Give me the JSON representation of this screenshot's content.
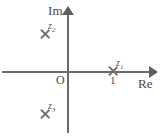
{
  "figure": {
    "background_color": "#ffffff",
    "line_color": "#6a6a6a"
  },
  "axes": {
    "imaginary_label": "Im",
    "real_label": "Re",
    "origin_label": "O",
    "tick_labels": [
      "1"
    ]
  },
  "chart_data": {
    "type": "scatter",
    "title": "",
    "xlabel": "Re",
    "ylabel": "Im",
    "xlim": [
      -1.6,
      2.1
    ],
    "ylim": [
      -1.7,
      1.6
    ],
    "grid": false,
    "legend": "none",
    "marker": "x",
    "xticks": [
      1
    ],
    "xticklabels": [
      "1"
    ],
    "yticks": [],
    "yticklabels": [],
    "points": [
      {
        "label": "z1",
        "label_text": "z",
        "subscript": "1",
        "x": 1.0,
        "y": 0.0
      },
      {
        "label": "z2",
        "label_text": "z",
        "subscript": "2",
        "x": -0.6,
        "y": 0.85
      },
      {
        "label": "z3",
        "label_text": "z",
        "subscript": "3",
        "x": -0.6,
        "y": -0.85
      }
    ]
  },
  "points": {
    "z1": {
      "name": "z",
      "sub": "1"
    },
    "z2": {
      "name": "z",
      "sub": "2"
    },
    "z3": {
      "name": "z",
      "sub": "3"
    }
  }
}
